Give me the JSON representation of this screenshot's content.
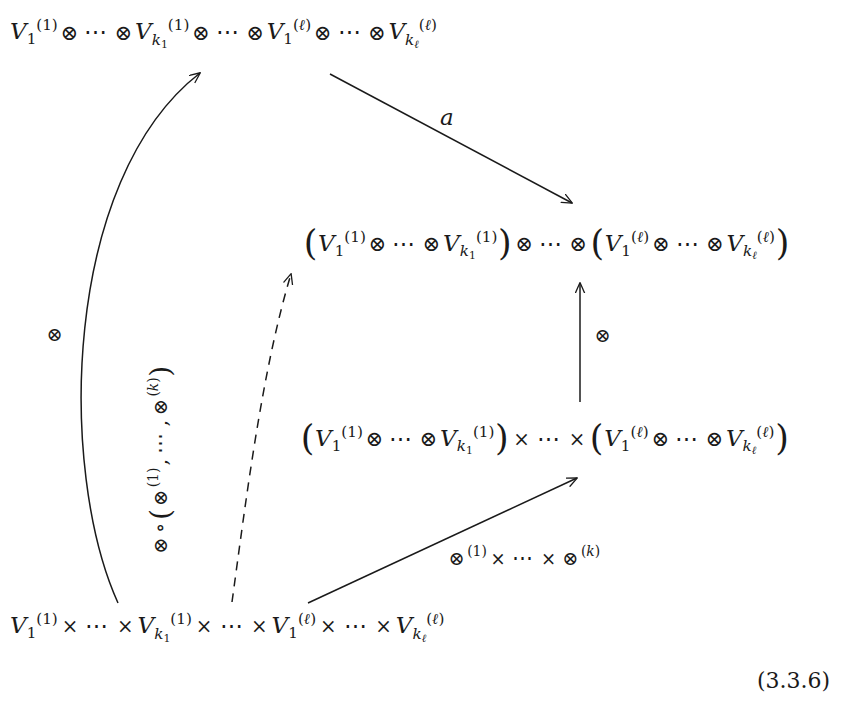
{
  "figure": {
    "kind": "commutative-diagram",
    "equation_number": "(3.3.6)"
  },
  "nodes": {
    "top_left": {
      "id": "node-top-tensor",
      "plain_text": "V_1^{(1)} ⊗ ⋯ ⊗ V_{k_1}^{(1)} ⊗ ⋯ ⊗ V_1^{(ℓ)} ⊗ ⋯ ⊗ V_{k_ℓ}^{(ℓ)}",
      "tokens": [
        {
          "t": "var",
          "base": "V",
          "sub": "1",
          "sup": "(1)"
        },
        {
          "t": "tensor",
          "sym": "⊗"
        },
        {
          "t": "dots",
          "sym": "⋯"
        },
        {
          "t": "tensor",
          "sym": "⊗"
        },
        {
          "t": "var",
          "base": "V",
          "sub": "k1",
          "sup": "(1)"
        },
        {
          "t": "tensor",
          "sym": "⊗"
        },
        {
          "t": "dots",
          "sym": "⋯"
        },
        {
          "t": "tensor",
          "sym": "⊗"
        },
        {
          "t": "var",
          "base": "V",
          "sub": "1",
          "sup": "(ℓ)"
        },
        {
          "t": "tensor",
          "sym": "⊗"
        },
        {
          "t": "dots",
          "sym": "⋯"
        },
        {
          "t": "tensor",
          "sym": "⊗"
        },
        {
          "t": "var",
          "base": "V",
          "sub": "kl",
          "sup": "(ℓ)"
        }
      ]
    },
    "middle_right": {
      "id": "node-middle-tensor-grouped",
      "plain_text": "(V_1^{(1)} ⊗ ⋯ ⊗ V_{k_1}^{(1)}) ⊗ ⋯ ⊗ (V_1^{(ℓ)} ⊗ ⋯ ⊗ V_{k_ℓ}^{(ℓ)})",
      "tokens": [
        {
          "t": "lparen",
          "sym": "("
        },
        {
          "t": "var",
          "base": "V",
          "sub": "1",
          "sup": "(1)"
        },
        {
          "t": "tensor",
          "sym": "⊗"
        },
        {
          "t": "dots",
          "sym": "⋯"
        },
        {
          "t": "tensor",
          "sym": "⊗"
        },
        {
          "t": "var",
          "base": "V",
          "sub": "k1",
          "sup": "(1)"
        },
        {
          "t": "rparen",
          "sym": ")"
        },
        {
          "t": "tensor",
          "sym": "⊗"
        },
        {
          "t": "dots",
          "sym": "⋯"
        },
        {
          "t": "tensor",
          "sym": "⊗"
        },
        {
          "t": "lparen",
          "sym": "("
        },
        {
          "t": "var",
          "base": "V",
          "sub": "1",
          "sup": "(ℓ)"
        },
        {
          "t": "tensor",
          "sym": "⊗"
        },
        {
          "t": "dots",
          "sym": "⋯"
        },
        {
          "t": "tensor",
          "sym": "⊗"
        },
        {
          "t": "var",
          "base": "V",
          "sub": "kl",
          "sup": "(ℓ)"
        },
        {
          "t": "rparen",
          "sym": ")"
        }
      ]
    },
    "lower_middle": {
      "id": "node-lower-product-grouped",
      "plain_text": "(V_1^{(1)} ⊗ ⋯ ⊗ V_{k_1}^{(1)}) × ⋯ × (V_1^{(ℓ)} ⊗ ⋯ ⊗ V_{k_ℓ}^{(ℓ)})",
      "tokens": [
        {
          "t": "lparen",
          "sym": "("
        },
        {
          "t": "var",
          "base": "V",
          "sub": "1",
          "sup": "(1)"
        },
        {
          "t": "tensor",
          "sym": "⊗"
        },
        {
          "t": "dots",
          "sym": "⋯"
        },
        {
          "t": "tensor",
          "sym": "⊗"
        },
        {
          "t": "var",
          "base": "V",
          "sub": "k1",
          "sup": "(1)"
        },
        {
          "t": "rparen",
          "sym": ")"
        },
        {
          "t": "cross",
          "sym": "×"
        },
        {
          "t": "dots",
          "sym": "⋯"
        },
        {
          "t": "cross",
          "sym": "×"
        },
        {
          "t": "lparen",
          "sym": "("
        },
        {
          "t": "var",
          "base": "V",
          "sub": "1",
          "sup": "(ℓ)"
        },
        {
          "t": "tensor",
          "sym": "⊗"
        },
        {
          "t": "dots",
          "sym": "⋯"
        },
        {
          "t": "tensor",
          "sym": "⊗"
        },
        {
          "t": "var",
          "base": "V",
          "sub": "kl",
          "sup": "(ℓ)"
        },
        {
          "t": "rparen",
          "sym": ")"
        }
      ]
    },
    "bottom_left": {
      "id": "node-bottom-product",
      "plain_text": "V_1^{(1)} × ⋯ × V_{k_1}^{(1)} × ⋯ × V_1^{(ℓ)} × ⋯ × V_{k_ℓ}^{(ℓ)}",
      "tokens": [
        {
          "t": "var",
          "base": "V",
          "sub": "1",
          "sup": "(1)"
        },
        {
          "t": "cross",
          "sym": "×"
        },
        {
          "t": "dots",
          "sym": "⋯"
        },
        {
          "t": "cross",
          "sym": "×"
        },
        {
          "t": "var",
          "base": "V",
          "sub": "k1",
          "sup": "(1)"
        },
        {
          "t": "cross",
          "sym": "×"
        },
        {
          "t": "dots",
          "sym": "⋯"
        },
        {
          "t": "cross",
          "sym": "×"
        },
        {
          "t": "var",
          "base": "V",
          "sub": "1",
          "sup": "(ℓ)"
        },
        {
          "t": "cross",
          "sym": "×"
        },
        {
          "t": "dots",
          "sym": "⋯"
        },
        {
          "t": "cross",
          "sym": "×"
        },
        {
          "t": "var",
          "base": "V",
          "sub": "kl",
          "sup": "(ℓ)"
        }
      ]
    }
  },
  "arrows": {
    "left_curve": {
      "id": "arrow-left-curve",
      "from": "bottom_left",
      "to": "top_left",
      "style": "solid",
      "label": "⊗",
      "label_plain": "⊗"
    },
    "diagonal_a": {
      "id": "arrow-diagonal-a",
      "from": "top_left",
      "to": "middle_right",
      "style": "solid",
      "label": "a",
      "label_plain": "a"
    },
    "vertical": {
      "id": "arrow-vertical",
      "from": "lower_middle",
      "to": "middle_right",
      "style": "solid",
      "label": "⊗",
      "label_plain": "⊗"
    },
    "bottom_diagonal": {
      "id": "arrow-bottom-diagonal",
      "from": "bottom_left",
      "to": "lower_middle",
      "style": "solid",
      "label_plain": "⊗^{(1)} × ⋯ × ⊗^{(k)}",
      "tokens": [
        {
          "t": "tensorsup",
          "sym": "⊗",
          "sup": "(1)"
        },
        {
          "t": "cross",
          "sym": "×"
        },
        {
          "t": "dots",
          "sym": "⋯"
        },
        {
          "t": "cross",
          "sym": "×"
        },
        {
          "t": "tensorsup",
          "sym": "⊗",
          "sup": "(k)"
        }
      ]
    },
    "dashed_diagonal": {
      "id": "arrow-dashed-diagonal",
      "from": "bottom_left",
      "to": "middle_right",
      "style": "dashed",
      "label_plain": "⊗ ∘ (⊗^{(1)}, ⋯ , ⊗^{(k)})",
      "label_rotation_deg": -90,
      "tokens": [
        {
          "t": "tensor",
          "sym": "⊗"
        },
        {
          "t": "circ",
          "sym": "∘"
        },
        {
          "t": "lparen",
          "sym": "("
        },
        {
          "t": "tensorsup",
          "sym": "⊗",
          "sup": "(1)"
        },
        {
          "t": "comma",
          "sym": ","
        },
        {
          "t": "dots",
          "sym": "⋯"
        },
        {
          "t": "comma",
          "sym": ","
        },
        {
          "t": "tensorsup",
          "sym": "⊗",
          "sup": "(k)"
        },
        {
          "t": "rparen",
          "sym": ")"
        }
      ]
    }
  },
  "symbols": {
    "tensor": "⊗",
    "cross": "×",
    "dots": "⋯",
    "circ": "∘",
    "comma": ",",
    "lparen": "(",
    "rparen": ")",
    "ell": "ℓ",
    "k": "k",
    "one": "1",
    "V": "V",
    "a": "a"
  },
  "colors": {
    "ink": "#1a1a1a",
    "background": "#ffffff"
  }
}
